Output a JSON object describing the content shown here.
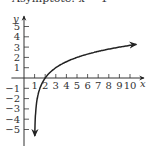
{
  "caption": "Asymptote: x = 1",
  "chart_data": {
    "type": "line",
    "title": "Asymptote: x = 1",
    "xlabel": "x",
    "ylabel": "y",
    "xlim": [
      -1,
      10.8
    ],
    "ylim": [
      -6,
      5.5
    ],
    "x_ticks": [
      1,
      2,
      3,
      4,
      5,
      6,
      7,
      8,
      9,
      10
    ],
    "y_ticks": [
      5,
      4,
      3,
      2,
      1,
      -1,
      -2,
      -3,
      -4,
      -5
    ],
    "grid": false,
    "series": [
      {
        "name": "y = log2(x - 1)",
        "function": "log2(x-1)",
        "x": [
          1.02,
          1.05,
          1.1,
          1.2,
          1.5,
          2,
          3,
          4,
          5,
          6,
          7,
          8,
          9,
          10,
          10.6
        ],
        "y": [
          -5.64,
          -4.32,
          -3.32,
          -2.32,
          -1,
          0,
          1,
          1.58,
          2,
          2.32,
          2.58,
          2.81,
          3,
          3.17,
          3.26
        ]
      }
    ],
    "asymptote": {
      "x": 1
    },
    "x_intercept": 2
  }
}
